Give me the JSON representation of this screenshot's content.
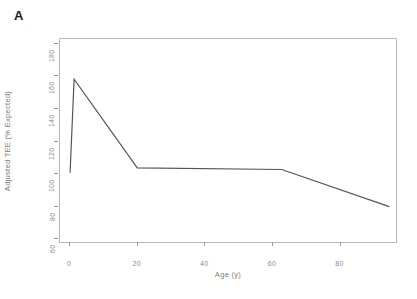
{
  "panel": {
    "label": "A"
  },
  "chart_data": {
    "type": "line",
    "title": "",
    "subtitle": "",
    "xlabel": "Age (y)",
    "ylabel": "Adjusted TEE (% Expected)",
    "xlim": [
      -3,
      97
    ],
    "ylim": [
      57,
      183
    ],
    "xticks": [
      0,
      20,
      40,
      60,
      80
    ],
    "xtick_labels": [
      "0",
      "20",
      "40",
      "60",
      "80"
    ],
    "yticks": [
      60,
      80,
      100,
      120,
      140,
      160,
      180
    ],
    "ytick_labels": [
      "60",
      "80",
      "100",
      "120",
      "140",
      "160",
      "180"
    ],
    "grid": false,
    "legend": null,
    "series": [
      {
        "name": "Adjusted TEE",
        "color": "#555555",
        "x": [
          0.0,
          1.2,
          20.0,
          63.0,
          95.0
        ],
        "y": [
          100.0,
          158.0,
          103.0,
          102.0,
          79.0
        ]
      }
    ],
    "annotations": []
  },
  "style": {
    "axis_color": "#b9b9b9",
    "tick_color": "#9a9a9a",
    "label_color": "#8c8c8c",
    "line_color": "#555555",
    "background": "#ffffff"
  }
}
